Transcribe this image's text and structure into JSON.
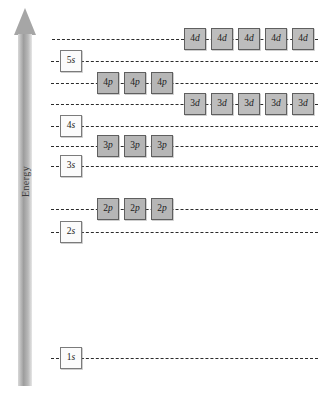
{
  "figure": {
    "axis_label": "Energy",
    "arrow_direction": "up",
    "background": "#ffffff",
    "line_color": "#2b2b2b",
    "s_box_color": "#fbfbfb",
    "p_box_color": "#b6b6b6",
    "d_box_color": "#bdbdbd"
  },
  "chart_data": {
    "type": "diagram",
    "title": "",
    "xlabel": "",
    "ylabel": "Energy",
    "grid": false,
    "legend": "none",
    "levels": [
      {
        "label": "4d",
        "n": "4",
        "l": "d",
        "orbitals": 5,
        "y": 39,
        "box_start_x": 184,
        "line_start_x": 52,
        "line_end_x": 318,
        "fill": "gray"
      },
      {
        "label": "5s",
        "n": "5",
        "l": "s",
        "orbitals": 1,
        "y": 61,
        "box_start_x": 60,
        "line_start_x": 51,
        "line_end_x": 318,
        "fill": "white"
      },
      {
        "label": "4p",
        "n": "4",
        "l": "p",
        "orbitals": 3,
        "y": 83,
        "box_start_x": 97,
        "line_start_x": 51,
        "line_end_x": 318,
        "fill": "gray"
      },
      {
        "label": "3d",
        "n": "3",
        "l": "d",
        "orbitals": 5,
        "y": 104,
        "box_start_x": 184,
        "line_start_x": 51,
        "line_end_x": 318,
        "fill": "gray"
      },
      {
        "label": "4s",
        "n": "4",
        "l": "s",
        "orbitals": 1,
        "y": 126,
        "box_start_x": 60,
        "line_start_x": 51,
        "line_end_x": 318,
        "fill": "white"
      },
      {
        "label": "3p",
        "n": "3",
        "l": "p",
        "orbitals": 3,
        "y": 146,
        "box_start_x": 97,
        "line_start_x": 51,
        "line_end_x": 318,
        "fill": "gray"
      },
      {
        "label": "3s",
        "n": "3",
        "l": "s",
        "orbitals": 1,
        "y": 166,
        "box_start_x": 60,
        "line_start_x": 51,
        "line_end_x": 318,
        "fill": "white"
      },
      {
        "label": "2p",
        "n": "2",
        "l": "p",
        "orbitals": 3,
        "y": 209,
        "box_start_x": 97,
        "line_start_x": 51,
        "line_end_x": 318,
        "fill": "gray"
      },
      {
        "label": "2s",
        "n": "2",
        "l": "s",
        "orbitals": 1,
        "y": 232,
        "box_start_x": 60,
        "line_start_x": 51,
        "line_end_x": 318,
        "fill": "white"
      },
      {
        "label": "1s",
        "n": "1",
        "l": "s",
        "orbitals": 1,
        "y": 358,
        "box_start_x": 60,
        "line_start_x": 51,
        "line_end_x": 318,
        "fill": "white"
      }
    ]
  }
}
